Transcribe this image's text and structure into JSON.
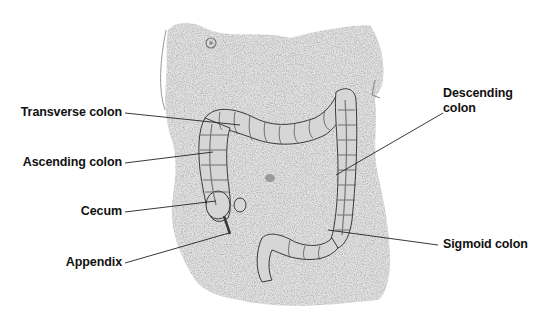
{
  "figure": {
    "colors": {
      "background": "#ffffff",
      "skin_stipple": "#b8b8b8",
      "colon_fill": "#d4d4d4",
      "colon_outline": "#3a3a3a",
      "label_text": "#111111",
      "leader_line": "#222222"
    }
  },
  "labels": {
    "transverse_colon": "Transverse colon",
    "ascending_colon": "Ascending colon",
    "cecum": "Cecum",
    "appendix": "Appendix",
    "descending_colon_line1": "Descending",
    "descending_colon_line2": "colon",
    "sigmoid_colon": "Sigmoid colon"
  }
}
